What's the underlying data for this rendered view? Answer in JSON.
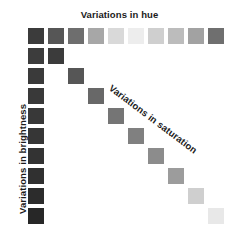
{
  "figure": {
    "background_color": "#ffffff",
    "width": 239,
    "height": 251
  },
  "labels": {
    "hue": "Variations in hue",
    "brightness": "Variations in brightness",
    "saturation": "Variations in saturation",
    "text_color": "#1b1b1b"
  },
  "chart_data": {
    "type": "heatmap",
    "title": "Variations in hue",
    "xlabel": "Variations in hue",
    "ylabel": "Variations in brightness",
    "annotations": [
      "Variations in saturation"
    ],
    "grid": false,
    "legend": "none",
    "geometry": {
      "origin_x": 28,
      "origin_y": 28,
      "cell_size": 16,
      "cell_pitch": 20,
      "columns": 10,
      "rows": 10
    },
    "series": [
      {
        "name": "Variations in hue",
        "axis": "top-row",
        "row_index": 0,
        "categories": [
          "h1",
          "h2",
          "h3",
          "h4",
          "h5",
          "h6",
          "h7",
          "h8",
          "h9",
          "h10"
        ],
        "values": [
          1,
          2,
          3,
          4,
          5,
          6,
          7,
          8,
          9,
          10
        ],
        "colors": [
          "#3b3b3b",
          "#565656",
          "#6e6e6e",
          "#a7a7a7",
          "#d9d9d9",
          "#ededed",
          "#cfcfcf",
          "#bcbcbc",
          "#a2a2a2",
          "#6f6f6f"
        ]
      },
      {
        "name": "Variations in brightness",
        "axis": "left-column",
        "column_index": 0,
        "categories": [
          "b1",
          "b2",
          "b3",
          "b4",
          "b5",
          "b6",
          "b7",
          "b8",
          "b9",
          "b10"
        ],
        "values": [
          1,
          2,
          3,
          4,
          5,
          6,
          7,
          8,
          9,
          10
        ],
        "colors": [
          "#3b3b3b",
          "#3c3c3c",
          "#3a3a3a",
          "#393939",
          "#383838",
          "#363636",
          "#333333",
          "#303030",
          "#2c2c2c",
          "#272727"
        ]
      },
      {
        "name": "Variations in saturation",
        "axis": "diagonal",
        "categories": [
          "s1",
          "s2",
          "s3",
          "s4",
          "s5",
          "s6",
          "s7",
          "s8",
          "s9",
          "s10"
        ],
        "values": [
          1,
          2,
          3,
          4,
          5,
          6,
          7,
          8,
          9,
          10
        ],
        "colors": [
          "#3b3b3b",
          "#565656",
          "#686868",
          "#757575",
          "#808080",
          "#8c8c8c",
          "#9c9c9c",
          "#bebebe",
          "#e0e0e0",
          "#f2f2f2"
        ]
      }
    ]
  },
  "swatches": {
    "hue_row": [
      {
        "name": "hue-swatch-1",
        "x": 28,
        "y": 28,
        "color": "#3b3b3b"
      },
      {
        "name": "hue-swatch-2",
        "x": 48,
        "y": 28,
        "color": "#565656"
      },
      {
        "name": "hue-swatch-3",
        "x": 68,
        "y": 28,
        "color": "#6e6e6e"
      },
      {
        "name": "hue-swatch-4",
        "x": 88,
        "y": 28,
        "color": "#a7a7a7"
      },
      {
        "name": "hue-swatch-5",
        "x": 108,
        "y": 28,
        "color": "#d9d9d9"
      },
      {
        "name": "hue-swatch-6",
        "x": 128,
        "y": 28,
        "color": "#ededed"
      },
      {
        "name": "hue-swatch-7",
        "x": 148,
        "y": 28,
        "color": "#cfcfcf"
      },
      {
        "name": "hue-swatch-8",
        "x": 168,
        "y": 28,
        "color": "#bcbcbc"
      },
      {
        "name": "hue-swatch-9",
        "x": 188,
        "y": 28,
        "color": "#a2a2a2"
      },
      {
        "name": "hue-swatch-10",
        "x": 208,
        "y": 28,
        "color": "#6f6f6f"
      }
    ],
    "brightness_column": [
      {
        "name": "brightness-swatch-1",
        "x": 28,
        "y": 28,
        "color": "#3b3b3b"
      },
      {
        "name": "brightness-swatch-2",
        "x": 28,
        "y": 48,
        "color": "#3c3c3c"
      },
      {
        "name": "brightness-swatch-3",
        "x": 28,
        "y": 68,
        "color": "#3a3a3a"
      },
      {
        "name": "brightness-swatch-4",
        "x": 28,
        "y": 88,
        "color": "#393939"
      },
      {
        "name": "brightness-swatch-5",
        "x": 28,
        "y": 108,
        "color": "#383838"
      },
      {
        "name": "brightness-swatch-6",
        "x": 28,
        "y": 128,
        "color": "#363636"
      },
      {
        "name": "brightness-swatch-7",
        "x": 28,
        "y": 148,
        "color": "#333333"
      },
      {
        "name": "brightness-swatch-8",
        "x": 28,
        "y": 168,
        "color": "#303030"
      },
      {
        "name": "brightness-swatch-9",
        "x": 28,
        "y": 188,
        "color": "#2c2c2c"
      },
      {
        "name": "brightness-swatch-10",
        "x": 28,
        "y": 208,
        "color": "#272727"
      }
    ],
    "saturation_diagonal": [
      {
        "name": "saturation-swatch-1",
        "x": 48,
        "y": 48,
        "color": "#3b3b3b"
      },
      {
        "name": "saturation-swatch-2",
        "x": 68,
        "y": 68,
        "color": "#565656"
      },
      {
        "name": "saturation-swatch-3",
        "x": 88,
        "y": 88,
        "color": "#686868"
      },
      {
        "name": "saturation-swatch-4",
        "x": 108,
        "y": 108,
        "color": "#757575"
      },
      {
        "name": "saturation-swatch-5",
        "x": 128,
        "y": 128,
        "color": "#808080"
      },
      {
        "name": "saturation-swatch-6",
        "x": 148,
        "y": 148,
        "color": "#8c8c8c"
      },
      {
        "name": "saturation-swatch-7",
        "x": 168,
        "y": 168,
        "color": "#9c9c9c"
      },
      {
        "name": "saturation-swatch-8",
        "x": 188,
        "y": 188,
        "color": "#cfcfcf"
      },
      {
        "name": "saturation-swatch-9",
        "x": 208,
        "y": 208,
        "color": "#e8e8e8"
      }
    ]
  }
}
